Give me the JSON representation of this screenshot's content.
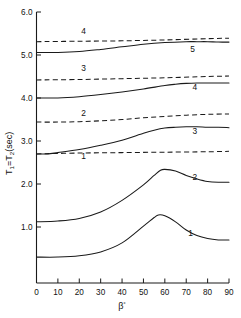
{
  "chart_data": {
    "type": "line",
    "title": "",
    "subtitle": "",
    "xlabel": "β₀",
    "xlabel_base": "β",
    "xlabel_sub": "₀",
    "ylabel": "T₁=T₂(sec)",
    "ylabel_parts": [
      "T",
      "1",
      "=T",
      "2",
      "(sec)"
    ],
    "xlim": [
      0,
      90
    ],
    "ylim": [
      0.0,
      6.0
    ],
    "grid": false,
    "legend": "inline-curve-labels",
    "xticks": [
      0,
      10,
      20,
      30,
      40,
      50,
      60,
      70,
      80,
      90
    ],
    "xtick_labels": [
      "0",
      "10",
      "20",
      "30",
      "40",
      "50",
      "60",
      "70",
      "80",
      "90"
    ],
    "yticks": [
      1.0,
      2.0,
      3.0,
      4.0,
      5.0,
      6.0
    ],
    "ytick_labels": [
      "1.0",
      "2.0",
      "3.0",
      "4.0",
      "5.0",
      "6.0"
    ],
    "line_color": "#1a1a1a",
    "series": [
      {
        "name": "1",
        "style": "solid",
        "label": "1",
        "label_x": 72,
        "label_y": 0.78,
        "x": [
          0,
          10,
          20,
          30,
          40,
          50,
          55,
          57,
          60,
          65,
          70,
          75,
          80,
          85,
          90
        ],
        "values": [
          0.3,
          0.3,
          0.33,
          0.42,
          0.63,
          1.02,
          1.22,
          1.28,
          1.26,
          1.12,
          0.93,
          0.8,
          0.73,
          0.7,
          0.7
        ]
      },
      {
        "name": "2",
        "style": "solid",
        "label": "2",
        "label_x": 74,
        "label_y": 2.1,
        "x": [
          0,
          10,
          20,
          30,
          40,
          50,
          55,
          58,
          60,
          65,
          70,
          75,
          80,
          85,
          90
        ],
        "values": [
          1.12,
          1.14,
          1.2,
          1.35,
          1.62,
          1.98,
          2.2,
          2.32,
          2.34,
          2.3,
          2.2,
          2.12,
          2.06,
          2.04,
          2.04
        ]
      },
      {
        "name": "3",
        "style": "solid",
        "label": "3",
        "label_x": 74,
        "label_y": 3.17,
        "x": [
          0,
          5,
          10,
          20,
          30,
          40,
          50,
          55,
          60,
          65,
          70,
          75,
          80,
          85,
          90
        ],
        "values": [
          2.7,
          2.7,
          2.73,
          2.8,
          2.9,
          3.02,
          3.18,
          3.25,
          3.3,
          3.32,
          3.33,
          3.33,
          3.32,
          3.32,
          3.31
        ]
      },
      {
        "name": "4",
        "style": "solid",
        "label": "4",
        "label_x": 74,
        "label_y": 4.18,
        "x": [
          0,
          10,
          20,
          30,
          40,
          50,
          60,
          65,
          70,
          75,
          80,
          85,
          90
        ],
        "values": [
          4.0,
          4.0,
          4.03,
          4.08,
          4.14,
          4.21,
          4.29,
          4.32,
          4.34,
          4.35,
          4.35,
          4.35,
          4.35
        ]
      },
      {
        "name": "5",
        "style": "solid",
        "label": "5",
        "label_x": 73,
        "label_y": 5.08,
        "x": [
          0,
          10,
          20,
          30,
          40,
          50,
          60,
          70,
          75,
          80,
          85,
          90
        ],
        "values": [
          5.06,
          5.06,
          5.08,
          5.13,
          5.19,
          5.25,
          5.29,
          5.31,
          5.31,
          5.31,
          5.3,
          5.3
        ]
      },
      {
        "name": "1d",
        "style": "dashed",
        "label": "1",
        "label_x": 22,
        "label_y": 2.57,
        "x": [
          0,
          20,
          40,
          60,
          80,
          90
        ],
        "values": [
          2.7,
          2.72,
          2.73,
          2.74,
          2.75,
          2.76
        ]
      },
      {
        "name": "2d",
        "style": "dashed",
        "label": "2",
        "label_x": 22,
        "label_y": 3.58,
        "x": [
          0,
          10,
          20,
          30,
          40,
          50,
          60,
          70,
          80,
          90
        ],
        "values": [
          3.44,
          3.44,
          3.45,
          3.47,
          3.5,
          3.54,
          3.57,
          3.6,
          3.62,
          3.63
        ]
      },
      {
        "name": "3d",
        "style": "dashed",
        "label": "3",
        "label_x": 22,
        "label_y": 4.62,
        "x": [
          0,
          20,
          40,
          60,
          80,
          90
        ],
        "values": [
          4.42,
          4.43,
          4.45,
          4.47,
          4.5,
          4.51
        ]
      },
      {
        "name": "4d",
        "style": "dashed",
        "label": "4",
        "label_x": 22,
        "label_y": 5.5,
        "x": [
          0,
          20,
          40,
          60,
          80,
          90
        ],
        "values": [
          5.31,
          5.32,
          5.33,
          5.35,
          5.38,
          5.39
        ]
      }
    ]
  }
}
